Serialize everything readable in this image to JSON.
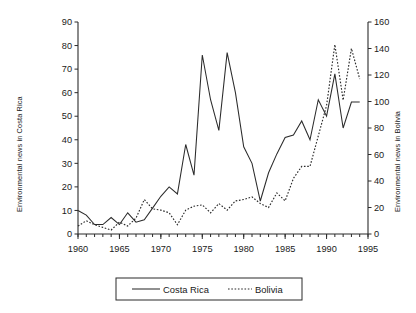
{
  "chart_data": {
    "type": "line",
    "title": "",
    "xlabel": "",
    "ylabel": "Environmental news in Costa Rica",
    "y2label": "Environmental news in Bolivia",
    "grid": false,
    "legend_position": "bottom",
    "xlim": [
      1960,
      1995
    ],
    "ylim": [
      0,
      90
    ],
    "y2lim": [
      0,
      160
    ],
    "x_ticks": [
      1960,
      1965,
      1970,
      1975,
      1980,
      1985,
      1990,
      1995
    ],
    "x_tick_labels": [
      "1960",
      "1965",
      "1970",
      "1975",
      "1980",
      "1985",
      "1990",
      "1995"
    ],
    "x_minor_tick_step": 1,
    "y_ticks": [
      0,
      10,
      20,
      30,
      40,
      50,
      60,
      70,
      80,
      90
    ],
    "y_tick_labels": [
      "0",
      "10",
      "20",
      "30",
      "40",
      "50",
      "60",
      "70",
      "80",
      "90"
    ],
    "y2_ticks": [
      0,
      20,
      40,
      60,
      80,
      100,
      120,
      140,
      160
    ],
    "y2_tick_labels": [
      "0",
      "20",
      "40",
      "60",
      "80",
      "100",
      "120",
      "140",
      "160"
    ],
    "x": [
      1960,
      1961,
      1962,
      1963,
      1964,
      1965,
      1966,
      1967,
      1968,
      1969,
      1970,
      1971,
      1972,
      1973,
      1974,
      1975,
      1976,
      1977,
      1978,
      1979,
      1980,
      1981,
      1982,
      1983,
      1984,
      1985,
      1986,
      1987,
      1988,
      1989,
      1990,
      1991,
      1992,
      1993,
      1994
    ],
    "series": [
      {
        "name": "Costa Rica",
        "axis": "left",
        "style": "solid",
        "color": "#2b2b2b",
        "values": [
          10,
          8,
          4,
          4,
          7,
          4,
          9,
          5,
          6,
          11,
          16,
          20,
          17,
          38,
          25,
          76,
          57,
          44,
          77,
          60,
          37,
          30,
          14,
          26,
          34,
          41,
          42,
          48,
          40,
          57,
          50,
          68,
          45,
          56,
          56
        ]
      },
      {
        "name": "Bolivia",
        "axis": "right",
        "style": "dotted",
        "color": "#2b2b2b",
        "values": [
          6,
          10,
          7,
          5,
          3,
          9,
          6,
          12,
          26,
          19,
          18,
          16,
          7,
          18,
          21,
          22,
          16,
          23,
          18,
          25,
          26,
          28,
          23,
          20,
          31,
          25,
          42,
          51,
          51,
          74,
          97,
          143,
          101,
          140,
          117
        ]
      }
    ]
  },
  "axes": {
    "left_title": "Environmental news in Costa Rica",
    "right_title": "Environmental news in Bolivia"
  },
  "legend": {
    "entries": [
      {
        "label": "Costa Rica",
        "style": "solid"
      },
      {
        "label": "Bolivia",
        "style": "dotted"
      }
    ]
  }
}
